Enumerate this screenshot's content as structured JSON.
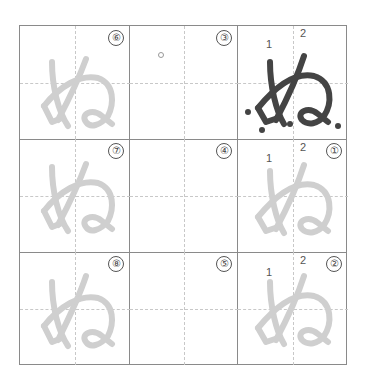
{
  "worksheet": {
    "character": "ぬ",
    "stroke_labels": [
      "1",
      "2"
    ],
    "colors": {
      "grid_line": "#8a8a8a",
      "guide_line": "#c8c8c8",
      "model_stroke": "#444444",
      "trace_stroke": "#cfcfcf"
    },
    "cells": [
      {
        "row": 0,
        "col": 0,
        "number": "⑥",
        "content": "trace"
      },
      {
        "row": 0,
        "col": 1,
        "number": "③",
        "content": "dot"
      },
      {
        "row": 0,
        "col": 2,
        "number": "",
        "content": "model",
        "stroke_labels": [
          "1",
          "2"
        ]
      },
      {
        "row": 1,
        "col": 0,
        "number": "⑦",
        "content": "trace"
      },
      {
        "row": 1,
        "col": 1,
        "number": "④",
        "content": "empty"
      },
      {
        "row": 1,
        "col": 2,
        "number": "①",
        "content": "trace",
        "stroke_labels": [
          "1",
          "2"
        ]
      },
      {
        "row": 2,
        "col": 0,
        "number": "⑧",
        "content": "trace"
      },
      {
        "row": 2,
        "col": 1,
        "number": "⑤",
        "content": "empty"
      },
      {
        "row": 2,
        "col": 2,
        "number": "②",
        "content": "trace",
        "stroke_labels": [
          "1",
          "2"
        ]
      }
    ]
  }
}
